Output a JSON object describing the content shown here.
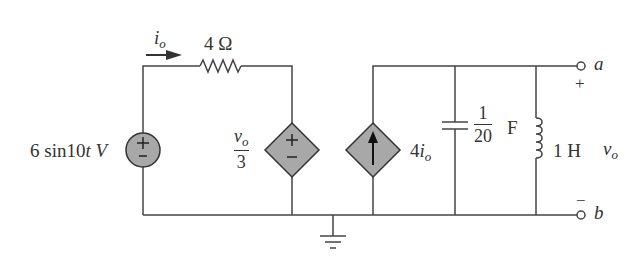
{
  "diagram": {
    "type": "circuit",
    "components": {
      "source_voltage": {
        "label": "6 sin10t V",
        "amplitude": "6",
        "func": "sin10",
        "var": "t",
        "unit": "V",
        "polarity_top": "+",
        "polarity_bottom": "−"
      },
      "current_label": {
        "symbol": "i",
        "subscript": "o"
      },
      "resistor": {
        "value": "4 Ω"
      },
      "dependent_voltage_source": {
        "numerator_symbol": "v",
        "numerator_subscript": "o",
        "denominator": "3",
        "polarity_top": "+",
        "polarity_bottom": "−"
      },
      "dependent_current_source": {
        "coef": "4",
        "symbol": "i",
        "subscript": "o"
      },
      "capacitor": {
        "numerator": "1",
        "denominator": "20",
        "unit": "F"
      },
      "inductor": {
        "value": "1 H"
      },
      "terminal_a": {
        "label": "a",
        "polarity": "+"
      },
      "terminal_b": {
        "label": "b",
        "polarity": "−"
      },
      "output_voltage": {
        "symbol": "v",
        "subscript": "o"
      }
    },
    "colors": {
      "wire": "#444444",
      "source_fill": "#a8a8a8",
      "label": "#333333"
    }
  }
}
